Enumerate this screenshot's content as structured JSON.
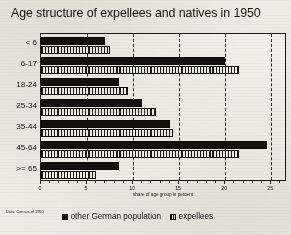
{
  "title": "Age structure of expellees and  natives in 1950",
  "source_note": "Data: Census of 1950",
  "axis": {
    "xlabel": "share of age group  in percent",
    "xticks": [
      "0",
      "5",
      "10",
      "15",
      "20",
      "25"
    ],
    "xmin": 0,
    "xmax": 26.5
  },
  "legend": {
    "items": [
      {
        "label": "other German population",
        "icon": "filled-square-swatch",
        "color": "#131313"
      },
      {
        "label": "expellees",
        "icon": "hatched-square-swatch",
        "color": "#151515"
      }
    ]
  },
  "chart_data": {
    "type": "bar",
    "orientation": "horizontal",
    "title": "Age structure of expellees and  natives in 1950",
    "xlabel": "share of age group  in percent",
    "ylabel": "",
    "xlim": [
      0,
      26.5
    ],
    "grid": true,
    "grid_axis": "x",
    "grid_style": "dashed",
    "legend_position": "bottom",
    "categories": [
      "< 6",
      "6-17",
      "18-24",
      "25-34",
      "35-44",
      "45-64",
      ">= 65"
    ],
    "series": [
      {
        "name": "other German population",
        "values": [
          7.0,
          20.0,
          8.5,
          11.0,
          14.0,
          24.5,
          8.5
        ]
      },
      {
        "name": "expellees",
        "values": [
          7.5,
          21.5,
          9.5,
          12.5,
          14.3,
          21.5,
          6.0
        ]
      }
    ]
  }
}
